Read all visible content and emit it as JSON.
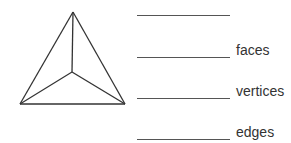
{
  "figure": {
    "shape": "tetrahedron",
    "vertices": {
      "apex": [
        73,
        12
      ],
      "left": [
        20,
        104
      ],
      "right": [
        125,
        104
      ],
      "center": [
        72,
        72
      ]
    },
    "stroke_color": "#333333"
  },
  "questions": [
    {
      "label": ""
    },
    {
      "label": "faces"
    },
    {
      "label": "vertices"
    },
    {
      "label": "edges"
    }
  ]
}
